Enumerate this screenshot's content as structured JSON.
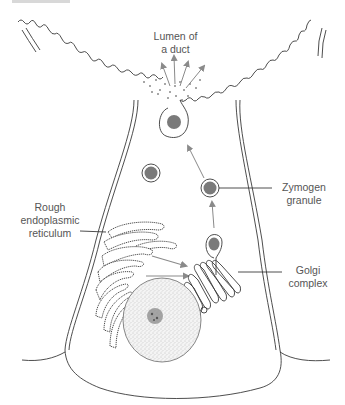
{
  "figure": {
    "colors": {
      "line": "#3a3a3a",
      "arrow": "#8a8a8a",
      "granule_fill": "#7a7a7a",
      "stipple": "#9a9a9a",
      "label_text": "#555555"
    }
  },
  "labels": {
    "lumen": {
      "line1": "Lumen of",
      "line2": "a duct"
    },
    "zymogen": {
      "line1": "Zymogen",
      "line2": "granule"
    },
    "rer": {
      "line1": "Rough",
      "line2": "endoplasmic",
      "line3": "reticulum"
    },
    "golgi": {
      "line1": "Golgi",
      "line2": "complex"
    }
  },
  "structures": [
    {
      "name": "lumen-of-duct",
      "description": "Lumen with microvilli border and released secretion"
    },
    {
      "name": "zymogen-granule",
      "count_visible": 5
    },
    {
      "name": "rough-endoplasmic-reticulum"
    },
    {
      "name": "golgi-complex"
    },
    {
      "name": "nucleus",
      "has_nucleolus": true
    },
    {
      "name": "cell-membrane"
    }
  ],
  "pathway_arrows": [
    "rough endoplasmic reticulum → golgi complex",
    "golgi complex → zymogen granule",
    "zymogen granule → apical membrane",
    "exocytosis → lumen of a duct"
  ]
}
